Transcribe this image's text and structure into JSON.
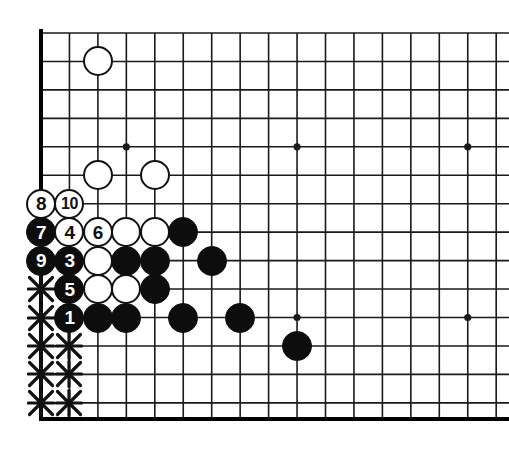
{
  "figure": {
    "kind": "go-board-diagram",
    "board_style": {
      "background_color": "#ffffff",
      "line_color": "#1a1a1a",
      "edge_line_color": "#000000",
      "black_stone_color": "#0d0d0d",
      "white_stone_color": "#ffffff",
      "white_stone_border_color": "#111111",
      "mark_color": "#111111"
    }
  },
  "geometry": {
    "width": 509,
    "height": 459,
    "origin_x": 41,
    "origin_y": 33,
    "spacing": 28.45,
    "columns": 17,
    "rows": 14,
    "bottom_edge_y": 419,
    "left_edge_x": 41,
    "top_edge_y": 33,
    "stone_diameter": 30,
    "edge_line_width": 4,
    "grid_line_width": 1.6
  },
  "star_points": [
    {
      "col": 3,
      "row": 4
    },
    {
      "col": 9,
      "row": 4
    },
    {
      "col": 15,
      "row": 4
    },
    {
      "col": 9,
      "row": 10
    },
    {
      "col": 15,
      "row": 10
    }
  ],
  "stones": [
    {
      "id": "w-a",
      "color": "white",
      "label": "",
      "col": 2,
      "row": 1
    },
    {
      "id": "w-b",
      "color": "white",
      "label": "",
      "col": 2,
      "row": 5
    },
    {
      "id": "w-c",
      "color": "white",
      "label": "",
      "col": 4,
      "row": 5
    },
    {
      "id": "m8",
      "color": "white",
      "label": "8",
      "col": 0,
      "row": 6
    },
    {
      "id": "m10",
      "color": "white",
      "label": "10",
      "col": 1,
      "row": 6
    },
    {
      "id": "m7",
      "color": "black",
      "label": "7",
      "col": 0,
      "row": 7
    },
    {
      "id": "m4",
      "color": "white",
      "label": "4",
      "col": 1,
      "row": 7
    },
    {
      "id": "m6",
      "color": "white",
      "label": "6",
      "col": 2,
      "row": 7
    },
    {
      "id": "w-d",
      "color": "white",
      "label": "",
      "col": 3,
      "row": 7
    },
    {
      "id": "w-e",
      "color": "white",
      "label": "",
      "col": 4,
      "row": 7
    },
    {
      "id": "b-a",
      "color": "black",
      "label": "",
      "col": 5,
      "row": 7
    },
    {
      "id": "m9",
      "color": "black",
      "label": "9",
      "col": 0,
      "row": 8
    },
    {
      "id": "m3",
      "color": "black",
      "label": "3",
      "col": 1,
      "row": 8
    },
    {
      "id": "w-f",
      "color": "white",
      "label": "",
      "col": 2,
      "row": 8
    },
    {
      "id": "b-b",
      "color": "black",
      "label": "",
      "col": 3,
      "row": 8
    },
    {
      "id": "b-c",
      "color": "black",
      "label": "",
      "col": 4,
      "row": 8
    },
    {
      "id": "b-d",
      "color": "black",
      "label": "",
      "col": 6,
      "row": 8
    },
    {
      "id": "m5",
      "color": "black",
      "label": "5",
      "col": 1,
      "row": 9
    },
    {
      "id": "w-g",
      "color": "white",
      "label": "",
      "col": 2,
      "row": 9
    },
    {
      "id": "w-h",
      "color": "white",
      "label": "",
      "col": 3,
      "row": 9
    },
    {
      "id": "b-e",
      "color": "black",
      "label": "",
      "col": 4,
      "row": 9
    },
    {
      "id": "m1",
      "color": "black",
      "label": "1",
      "col": 1,
      "row": 10
    },
    {
      "id": "b-f",
      "color": "black",
      "label": "",
      "col": 2,
      "row": 10
    },
    {
      "id": "b-g",
      "color": "black",
      "label": "",
      "col": 3,
      "row": 10
    },
    {
      "id": "b-h",
      "color": "black",
      "label": "",
      "col": 5,
      "row": 10
    },
    {
      "id": "b-i",
      "color": "black",
      "label": "",
      "col": 7,
      "row": 10
    },
    {
      "id": "b-j",
      "color": "black",
      "label": "",
      "col": 9,
      "row": 11
    }
  ],
  "x_marks": [
    {
      "col": 0,
      "row": 9
    },
    {
      "col": 0,
      "row": 10
    },
    {
      "col": 0,
      "row": 11
    },
    {
      "col": 0,
      "row": 12
    },
    {
      "col": 0,
      "row": 13
    },
    {
      "col": 1,
      "row": 11
    },
    {
      "col": 1,
      "row": 12
    },
    {
      "col": 1,
      "row": 13
    }
  ],
  "move_sequence": [
    {
      "number": "1",
      "color": "black"
    },
    {
      "number": "3",
      "color": "black"
    },
    {
      "number": "4",
      "color": "white"
    },
    {
      "number": "5",
      "color": "black"
    },
    {
      "number": "6",
      "color": "white"
    },
    {
      "number": "7",
      "color": "black"
    },
    {
      "number": "8",
      "color": "white"
    },
    {
      "number": "9",
      "color": "black"
    },
    {
      "number": "10",
      "color": "white"
    }
  ]
}
